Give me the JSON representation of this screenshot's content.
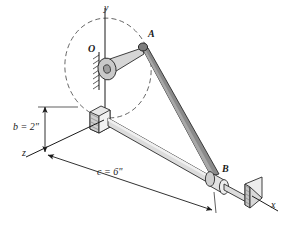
{
  "figure": {
    "background_color": "#ffffff",
    "line_color": "#1a1a1a"
  },
  "axes": {
    "y": {
      "label": "y"
    },
    "x": {
      "label": "x"
    },
    "z": {
      "label": "z"
    }
  },
  "points": {
    "O": {
      "label": "O",
      "role": "crank-pivot"
    },
    "A": {
      "label": "A",
      "role": "crank-pin"
    },
    "B": {
      "label": "B",
      "role": "slider-joint"
    }
  },
  "dimensions": {
    "b": {
      "label": "b = 2\"",
      "symbol": "b",
      "value": 2,
      "unit": "in"
    },
    "c": {
      "label": "c = 6\"",
      "symbol": "c",
      "value": 6,
      "unit": "in"
    }
  },
  "members": {
    "crank": {
      "name": "crank-arm-OA",
      "fill": "#d4d4d4"
    },
    "rod": {
      "name": "connecting-rod-AB",
      "fill": "#8a8a8a"
    },
    "guide": {
      "name": "guide-rod",
      "fill": "#dcdcdc"
    },
    "collar": {
      "name": "slider-collar-B",
      "fill": "#e2e2e2"
    },
    "bracket": {
      "name": "support-bracket",
      "fill": "#e8e8e8"
    },
    "endblock": {
      "name": "end-block",
      "fill": "#e0e0e0"
    },
    "hub": {
      "name": "pivot-hub-O",
      "fill": "#c9c9c9"
    }
  },
  "annotations": {
    "rotation_path": "dashed ellipse showing crank rotation plane",
    "wall_hatch": "hatched fixed support at pivot"
  }
}
